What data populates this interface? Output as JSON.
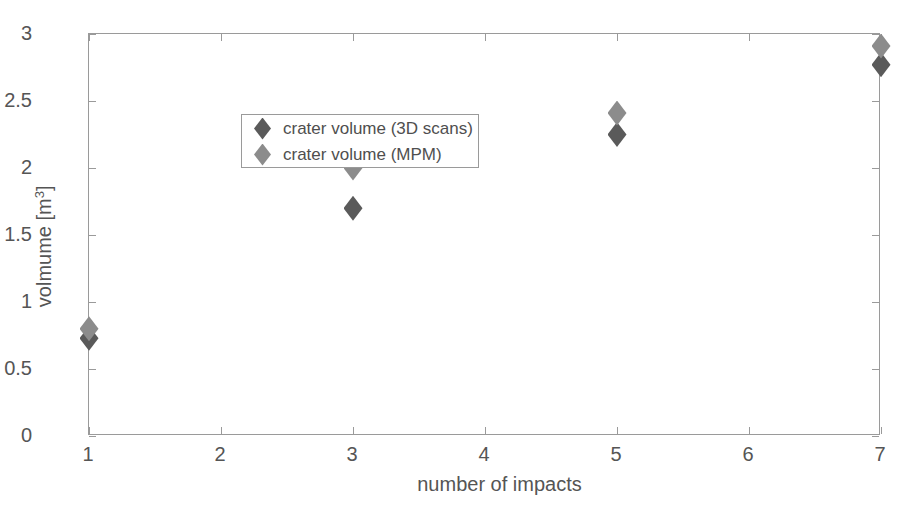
{
  "chart_data": {
    "type": "scatter",
    "title": "",
    "xlabel": "number of impacts",
    "ylabel": "volmume [m",
    "ylabel_sup": "3",
    "ylabel_tail": "]",
    "xlim": [
      1,
      7
    ],
    "ylim": [
      0,
      3
    ],
    "grid": false,
    "legend_position": "upper left inside",
    "xticks": [
      1,
      2,
      3,
      4,
      5,
      6,
      7
    ],
    "xtick_labels": [
      "1",
      "2",
      "3",
      "4",
      "5",
      "6",
      "7"
    ],
    "yticks": [
      0,
      0.5,
      1,
      1.5,
      2,
      2.5,
      3
    ],
    "ytick_labels": [
      "0",
      "0.5",
      "1",
      "1.5",
      "2",
      "2.5",
      "3"
    ],
    "x": [
      1,
      3,
      5,
      7
    ],
    "series": [
      {
        "name": "crater volume (3D scans)",
        "color": "#5a5a5a",
        "marker": "diamond",
        "values": [
          0.73,
          1.7,
          2.25,
          2.77
        ]
      },
      {
        "name": "crater volume (MPM)",
        "color": "#8c8c8c",
        "marker": "diamond",
        "values": [
          0.8,
          2.0,
          2.41,
          2.91
        ]
      }
    ]
  },
  "colors": {
    "axis": "#9a9a9a",
    "text": "#555555",
    "background": "#ffffff"
  }
}
